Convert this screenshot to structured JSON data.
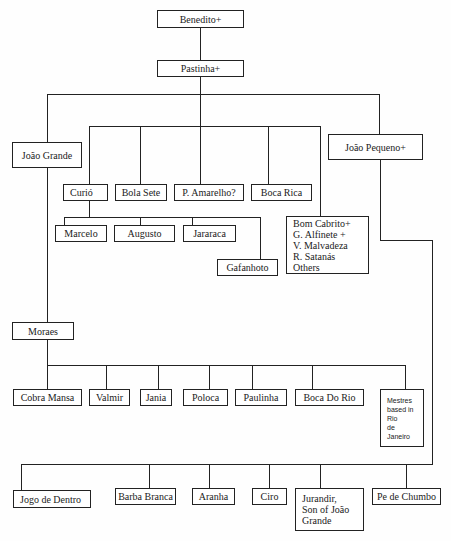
{
  "diagram": {
    "type": "lineage-tree",
    "nodes": {
      "benedito": "Benedito+",
      "pastinha": "Pastinha+",
      "joao_grande": "João Grande",
      "joao_pequeno": "João Pequeno+",
      "curio": "Curió",
      "bola_sete": "Bola Sete",
      "p_amarelho": "P. Amarelho?",
      "boca_rica": "Boca Rica",
      "marcelo": "Marcelo",
      "augusto": "Augusto",
      "jararaca": "Jararaca",
      "gafanhoto": "Gafanhoto",
      "others_group": [
        "Bom Cabrito+",
        "G. Alfinete +",
        "V. Malvadeza",
        "R. Satanás",
        "Others"
      ],
      "moraes": "Moraes",
      "cobra_mansa": "Cobra Mansa",
      "valmir": "Valmir",
      "jania": "Jania",
      "poloca": "Poloca",
      "paulinha": "Paulinha",
      "boca_do_rio": "Boca Do Rio",
      "mestres_rio": [
        "Mestres",
        "based in",
        "Rio",
        "de",
        "Janeiro"
      ],
      "jogo_de_dentro": "Jogo de Dentro",
      "barba_branca": "Barba Branca",
      "aranha": "Aranha",
      "ciro": "Ciro",
      "jurandir": [
        "Jurandir,",
        "Son of João",
        "Grande"
      ],
      "pe_de_chumbo": "Pe de Chumbo"
    },
    "edges": [
      [
        "Benedito+",
        "Pastinha+"
      ],
      [
        "Pastinha+",
        "João Grande"
      ],
      [
        "Pastinha+",
        "Curió"
      ],
      [
        "Pastinha+",
        "Bola Sete"
      ],
      [
        "Pastinha+",
        "P. Amarelho?"
      ],
      [
        "Pastinha+",
        "Boca Rica"
      ],
      [
        "Pastinha+",
        "Bom Cabrito+ / Others"
      ],
      [
        "Pastinha+",
        "João Pequeno+"
      ],
      [
        "Curió",
        "Marcelo"
      ],
      [
        "Curió",
        "Augusto"
      ],
      [
        "Curió",
        "Jararaca"
      ],
      [
        "Curió",
        "Gafanhoto"
      ],
      [
        "João Grande",
        "Moraes"
      ],
      [
        "Moraes",
        "Cobra Mansa"
      ],
      [
        "Moraes",
        "Valmir"
      ],
      [
        "Moraes",
        "Jania"
      ],
      [
        "Moraes",
        "Poloca"
      ],
      [
        "Moraes",
        "Paulinha"
      ],
      [
        "Moraes",
        "Boca Do Rio"
      ],
      [
        "Moraes",
        "Mestres based in Rio de Janeiro"
      ],
      [
        "João Pequeno+",
        "Jogo de Dentro"
      ],
      [
        "João Pequeno+",
        "Barba Branca"
      ],
      [
        "João Pequeno+",
        "Aranha"
      ],
      [
        "João Pequeno+",
        "Ciro"
      ],
      [
        "João Pequeno+",
        "Jurandir, Son of João Grande"
      ],
      [
        "João Pequeno+",
        "Pe de Chumbo"
      ]
    ]
  }
}
